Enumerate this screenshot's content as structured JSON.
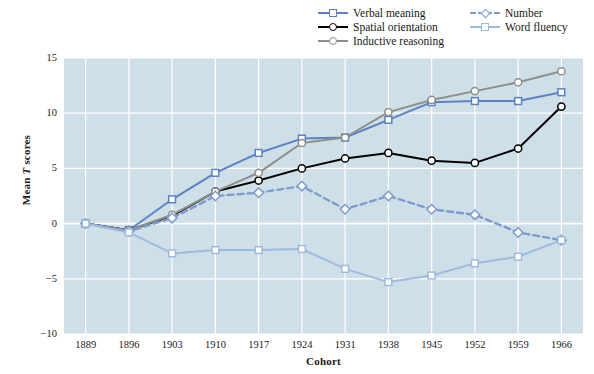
{
  "chart_data": {
    "type": "line",
    "title": "",
    "xlabel": "Cohort",
    "ylabel": "Mean T scores",
    "ylabel_plain": "Mean ",
    "ylabel_italic": "T",
    "ylabel_tail": " scores",
    "categories": [
      "1889",
      "1896",
      "1903",
      "1910",
      "1917",
      "1924",
      "1931",
      "1938",
      "1945",
      "1952",
      "1959",
      "1966"
    ],
    "ylim": [
      -10,
      15
    ],
    "yticks": [
      15,
      10,
      5,
      0,
      -5,
      -10
    ],
    "ytick_labels": [
      "15",
      "10",
      "5",
      "0",
      "−5",
      "−10"
    ],
    "grid": true,
    "grid_color": "#ffffff",
    "plot_background": "#cfdfe8",
    "legend_position": "top-right",
    "series": [
      {
        "name": "Verbal meaning",
        "color": "#5b82c4",
        "marker": "square",
        "dash": "solid",
        "values": [
          0,
          -0.6,
          2.2,
          4.6,
          6.4,
          7.7,
          7.8,
          9.4,
          11.0,
          11.1,
          11.1,
          11.9
        ]
      },
      {
        "name": "Spatial orientation",
        "color": "#000000",
        "marker": "circle",
        "dash": "solid",
        "values": [
          0,
          -0.6,
          0.7,
          2.9,
          3.9,
          5.0,
          5.9,
          6.4,
          5.7,
          5.5,
          6.8,
          10.6
        ]
      },
      {
        "name": "Inductive reasoning",
        "color": "#8d8f8a",
        "marker": "circle",
        "dash": "solid",
        "values": [
          0,
          -0.6,
          0.8,
          2.9,
          4.6,
          7.3,
          7.8,
          10.1,
          11.2,
          12.0,
          12.8,
          13.8
        ]
      },
      {
        "name": "Number",
        "color": "#7e9ad1",
        "marker": "diamond",
        "dash": "dashed",
        "values": [
          0,
          -0.7,
          0.5,
          2.5,
          2.8,
          3.4,
          1.3,
          2.5,
          1.3,
          0.8,
          -0.8,
          -1.5
        ]
      },
      {
        "name": "Word fluency",
        "color": "#9fbade",
        "marker": "square",
        "dash": "solid",
        "values": [
          0,
          -0.8,
          -2.7,
          -2.4,
          -2.4,
          -2.3,
          -4.1,
          -5.3,
          -4.7,
          -3.6,
          -3.0,
          -1.5
        ]
      }
    ]
  },
  "legend": {
    "column_a": [
      "Verbal meaning",
      "Spatial orientation",
      "Inductive reasoning"
    ],
    "column_b": [
      "Number",
      "Word fluency"
    ]
  }
}
